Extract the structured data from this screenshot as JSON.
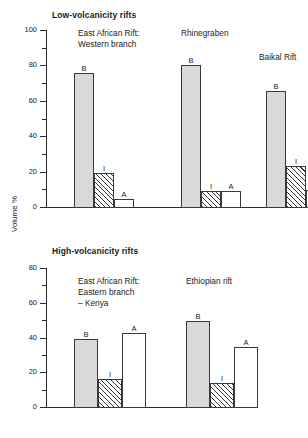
{
  "figure": {
    "ylabel": "Volume %"
  },
  "panels": [
    {
      "id": "low",
      "title": "Low-volcanicity rifts",
      "ylim": [
        0,
        100
      ],
      "major_ticks": [
        0,
        20,
        40,
        60,
        80,
        100
      ],
      "minor_ticks": [
        10,
        30,
        50,
        70,
        90
      ],
      "groups": [
        {
          "name": "East African Rift: Western branch",
          "label_lines": [
            "East African Rift:",
            "Western branch"
          ],
          "bars": [
            {
              "label": "B",
              "value": 76,
              "style": "b"
            },
            {
              "label": "I",
              "value": 20,
              "style": "i"
            },
            {
              "label": "A",
              "value": 5,
              "style": "a"
            }
          ]
        },
        {
          "name": "Rhinegraben",
          "label_lines": [
            "Rhinegraben"
          ],
          "bars": [
            {
              "label": "B",
              "value": 81,
              "style": "b"
            },
            {
              "label": "I",
              "value": 9.5,
              "style": "i"
            },
            {
              "label": "A",
              "value": 9.5,
              "style": "a"
            }
          ]
        },
        {
          "name": "Baikal Rift",
          "label_lines": [
            "Baikal Rift"
          ],
          "bars": [
            {
              "label": "B",
              "value": 66,
              "style": "b"
            },
            {
              "label": "I",
              "value": 24,
              "style": "i"
            },
            {
              "label": "A",
              "value": 10,
              "style": "a"
            }
          ]
        }
      ]
    },
    {
      "id": "high",
      "title": "High-volcanicity rifts",
      "ylim": [
        0,
        80
      ],
      "major_ticks": [
        0,
        20,
        40,
        60,
        80
      ],
      "minor_ticks": [
        10,
        30,
        50,
        70
      ],
      "groups": [
        {
          "name": "East African Rift: Eastern branch - Kenya",
          "label_lines": [
            "East African Rift:",
            "Eastern branch",
            "– Kenya"
          ],
          "bars": [
            {
              "label": "B",
              "value": 40,
              "style": "b"
            },
            {
              "label": "I",
              "value": 16.5,
              "style": "i"
            },
            {
              "label": "A",
              "value": 43,
              "style": "a"
            }
          ]
        },
        {
          "name": "Ethiopian rift",
          "label_lines": [
            "Ethiopian rift"
          ],
          "bars": [
            {
              "label": "B",
              "value": 50,
              "style": "b"
            },
            {
              "label": "I",
              "value": 14.5,
              "style": "i"
            },
            {
              "label": "A",
              "value": 35,
              "style": "a"
            }
          ]
        }
      ]
    }
  ],
  "chart_data": {
    "type": "bar",
    "xlabel": "",
    "ylabel": "Volume %",
    "grid": false,
    "legend": "none",
    "bar_categories": [
      "B",
      "I",
      "A"
    ],
    "panels": [
      {
        "title": "Low-volcanicity rifts",
        "ylim": [
          0,
          100
        ],
        "yticks": [
          0,
          20,
          40,
          60,
          80,
          100
        ],
        "minor_yticks": [
          10,
          30,
          50,
          70,
          90
        ],
        "categories": [
          "East African Rift: Western branch",
          "Rhinegraben",
          "Baikal Rift"
        ],
        "series": [
          {
            "name": "B",
            "values": [
              76,
              81,
              66
            ]
          },
          {
            "name": "I",
            "values": [
              20,
              9.5,
              24
            ]
          },
          {
            "name": "A",
            "values": [
              5,
              9.5,
              10
            ]
          }
        ]
      },
      {
        "title": "High-volcanicity rifts",
        "ylim": [
          0,
          80
        ],
        "yticks": [
          0,
          20,
          40,
          60,
          80
        ],
        "minor_yticks": [
          10,
          30,
          50,
          70
        ],
        "categories": [
          "East African Rift: Eastern branch – Kenya",
          "Ethiopian rift"
        ],
        "series": [
          {
            "name": "B",
            "values": [
              40,
              50
            ]
          },
          {
            "name": "I",
            "values": [
              16.5,
              14.5
            ]
          },
          {
            "name": "A",
            "values": [
              43,
              35
            ]
          }
        ]
      }
    ]
  }
}
